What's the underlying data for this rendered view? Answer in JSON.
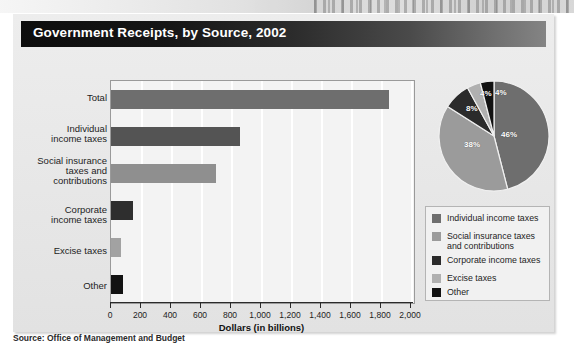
{
  "title": "Government Receipts, by Source, 2002",
  "source_note": "Source:  Office of Management and Budget",
  "colors": {
    "title_bar_dark": "#0d0d0d",
    "card_bg": "#e9e9e9",
    "plot_bg": "#f3f3f3",
    "gridline": "#ffffff",
    "total": "#6e6e6e",
    "individual": "#545454",
    "social": "#8f8f8f",
    "corporate": "#2e2e2e",
    "excise": "#a2a2a2",
    "other": "#121212"
  },
  "chart_data": [
    {
      "type": "bar",
      "orientation": "horizontal",
      "title": "Government Receipts, by Source, 2002",
      "xlabel": "Dollars (in billions)",
      "ylabel": "",
      "xlim": [
        0,
        2000
      ],
      "grid": true,
      "xticks": [
        0,
        200,
        400,
        600,
        800,
        1000,
        1200,
        1400,
        1600,
        1800,
        2000
      ],
      "xticklabels": [
        "0",
        "200",
        "400",
        "600",
        "800",
        "1,000",
        "1,200",
        "1,400",
        "1,600",
        "1,800",
        "2,000"
      ],
      "categories": [
        "Total",
        "Individual income taxes",
        "Social insurance taxes and contributions",
        "Corporate income taxes",
        "Excise taxes",
        "Other"
      ],
      "values": [
        1853,
        858,
        701,
        148,
        67,
        79
      ],
      "bar_colors": [
        "#6e6e6e",
        "#545454",
        "#8f8f8f",
        "#2e2e2e",
        "#a2a2a2",
        "#121212"
      ]
    },
    {
      "type": "pie",
      "title": "",
      "labels": [
        "Individual income taxes",
        "Social insurance taxes and contributions",
        "Corporate income taxes",
        "Excise taxes",
        "Other"
      ],
      "values": [
        46,
        38,
        8,
        4,
        4
      ],
      "datalabels": [
        "46%",
        "38%",
        "8%",
        "4%",
        "4%"
      ],
      "slice_colors": [
        "#6e6e6e",
        "#9b9b9b",
        "#2b2b2b",
        "#121212",
        "#b0b0b0"
      ],
      "legend_position": "bottom"
    }
  ],
  "bar_labels": {
    "total": "Total",
    "individual": "Individual\nincome taxes",
    "individual_l1": "Individual",
    "individual_l2": "income taxes",
    "social_l1": "Social insurance",
    "social_l2": "taxes and",
    "social_l3": "contributions",
    "corporate_l1": "Corporate",
    "corporate_l2": "income taxes",
    "excise": "Excise taxes",
    "other": "Other"
  },
  "axis": {
    "x_title": "Dollars (in billions)",
    "t0": "0",
    "t200": "200",
    "t400": "400",
    "t600": "600",
    "t800": "800",
    "t1000": "1,000",
    "t1200": "1,200",
    "t1400": "1,400",
    "t1600": "1,600",
    "t1800": "1,800",
    "t2000": "2,000"
  },
  "pie_labels": {
    "p1": "46%",
    "p2": "38%",
    "p3": "8%",
    "p4": "4%",
    "p5": "4%"
  },
  "legend": {
    "items": [
      {
        "label_l1": "Individual income taxes",
        "label_l2": "",
        "color": "#6e6e6e"
      },
      {
        "label_l1": "Social insurance taxes",
        "label_l2": "and contributions",
        "color": "#9b9b9b"
      },
      {
        "label_l1": "Corporate income taxes",
        "label_l2": "",
        "color": "#2b2b2b"
      },
      {
        "label_l1": "Excise taxes",
        "label_l2": "",
        "color": "#b0b0b0"
      },
      {
        "label_l1": "Other",
        "label_l2": "",
        "color": "#121212"
      }
    ]
  }
}
